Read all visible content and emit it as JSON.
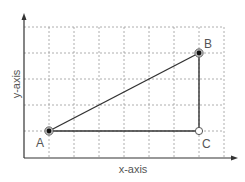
{
  "diagram": {
    "x_axis_label": "x-axis",
    "y_axis_label": "y-axis",
    "colors": {
      "axis": "#333333",
      "grid": "#9a9a9a",
      "edge": "#333333",
      "point_fill": "#111111",
      "open_point_fill": "#ffffff",
      "label": "#555555"
    },
    "grid": {
      "columns": 8,
      "rows": 5
    },
    "points": [
      {
        "label": "A",
        "grid_x": 1,
        "grid_y": 1,
        "style": "filled"
      },
      {
        "label": "B",
        "grid_x": 7,
        "grid_y": 4,
        "style": "filled"
      },
      {
        "label": "C",
        "grid_x": 7,
        "grid_y": 1,
        "style": "open"
      }
    ],
    "edges": [
      {
        "from": "A",
        "to": "B"
      },
      {
        "from": "B",
        "to": "C"
      },
      {
        "from": "A",
        "to": "C"
      }
    ]
  }
}
